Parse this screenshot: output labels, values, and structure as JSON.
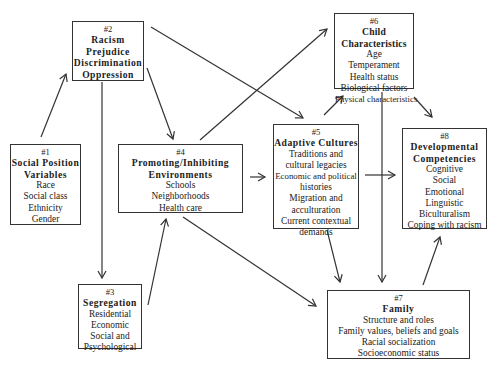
{
  "diagram": {
    "boxes": {
      "b1": {
        "number": "#1",
        "title": [
          "Social Position",
          "Variables"
        ],
        "items": [
          "Race",
          "Social class",
          "Ethnicity",
          "Gender"
        ]
      },
      "b2": {
        "number": "#2",
        "title": [
          "Racism",
          "Prejudice",
          "Discrimination",
          "Oppression"
        ],
        "items": []
      },
      "b3": {
        "number": "#3",
        "title": [
          "Segregation"
        ],
        "items": [
          "Residential",
          "Economic",
          "Social and",
          "Psychological"
        ]
      },
      "b4": {
        "number": "#4",
        "title": [
          "Promoting/Inhibiting",
          "Environments"
        ],
        "items": [
          "Schools",
          "Neighborhoods",
          "Health care"
        ]
      },
      "b5": {
        "number": "#5",
        "title": [
          "Adaptive Cultures"
        ],
        "items": [
          "Traditions and",
          "cultural legacies",
          "Economic and political",
          "histories",
          "Migration and",
          "acculturation",
          "Current contextual",
          "demands"
        ]
      },
      "b6": {
        "number": "#6",
        "title": [
          "Child Characteristics"
        ],
        "items": [
          "Age",
          "Temperament",
          "Health status",
          "Biological factors",
          "Physical characteristics"
        ]
      },
      "b7": {
        "number": "#7",
        "title": [
          "Family"
        ],
        "items": [
          "Structure and roles",
          "Family values, beliefs and goals",
          "Racial socialization",
          "Socioeconomic status"
        ]
      },
      "b8": {
        "number": "#8",
        "title": [
          "Developmental",
          "Competencies"
        ],
        "items": [
          "Cognitive",
          "Social",
          "Emotional",
          "Linguistic",
          "Biculturalism",
          "Coping with racism"
        ]
      }
    },
    "edges": [
      {
        "from": "#1",
        "to": "#2"
      },
      {
        "from": "#2",
        "to": "#3"
      },
      {
        "from": "#2",
        "to": "#4"
      },
      {
        "from": "#2",
        "to": "#5"
      },
      {
        "from": "#3",
        "to": "#4"
      },
      {
        "from": "#4",
        "to": "#5"
      },
      {
        "from": "#4",
        "to": "#6"
      },
      {
        "from": "#4",
        "to": "#7"
      },
      {
        "from": "#5",
        "to": "#6"
      },
      {
        "from": "#5",
        "to": "#7"
      },
      {
        "from": "#5",
        "to": "#8"
      },
      {
        "from": "#6",
        "to": "#7"
      },
      {
        "from": "#6",
        "to": "#8"
      },
      {
        "from": "#7",
        "to": "#8"
      }
    ]
  }
}
